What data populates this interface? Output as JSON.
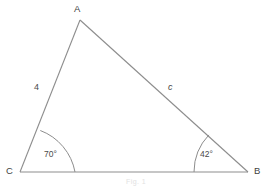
{
  "figure": {
    "type": "triangle-diagram",
    "background_color": "#ffffff",
    "stroke_color": "#8d8d8d",
    "text_color": "#4a4a4a",
    "vertices": {
      "A": {
        "label": "A",
        "x": 80,
        "y": 20,
        "label_x": 74,
        "label_y": 4
      },
      "B": {
        "label": "B",
        "x": 248,
        "y": 172,
        "label_x": 254,
        "label_y": 166
      },
      "C": {
        "label": "C",
        "x": 20,
        "y": 172,
        "label_x": 6,
        "label_y": 166
      }
    },
    "sides": [
      {
        "name": "side-ca",
        "label": "4",
        "from": "C",
        "to": "A",
        "label_x": 34,
        "label_y": 83,
        "italic": false
      },
      {
        "name": "side-ab",
        "label": "c",
        "from": "A",
        "to": "B",
        "label_x": 168,
        "label_y": 83,
        "italic": true
      }
    ],
    "angles": [
      {
        "name": "angle-c",
        "label": "70°",
        "at": "C",
        "value": 70,
        "arc_radius": 55,
        "label_x": 44,
        "label_y": 150
      },
      {
        "name": "angle-b",
        "label": "42°",
        "at": "B",
        "value": 42,
        "arc_radius": 54,
        "label_x": 200,
        "label_y": 150
      }
    ],
    "caption": "Fig. 1"
  }
}
